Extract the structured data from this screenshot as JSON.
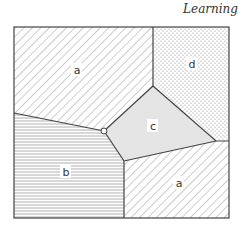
{
  "header": {
    "title": "Learning"
  },
  "diagram": {
    "type": "voronoi-partition",
    "regions": [
      {
        "id": "a-top",
        "label": "a",
        "pattern": "diagonal-hatch"
      },
      {
        "id": "d",
        "label": "d",
        "pattern": "dots"
      },
      {
        "id": "c",
        "label": "c",
        "pattern": "fine-stipple"
      },
      {
        "id": "b",
        "label": "b",
        "pattern": "horizontal-lines"
      },
      {
        "id": "a-bottom",
        "label": "a",
        "pattern": "diagonal-hatch"
      }
    ],
    "colors": {
      "line": "#444444",
      "hatch": "#999999",
      "stipple_bg": "#e6e6e6"
    }
  }
}
